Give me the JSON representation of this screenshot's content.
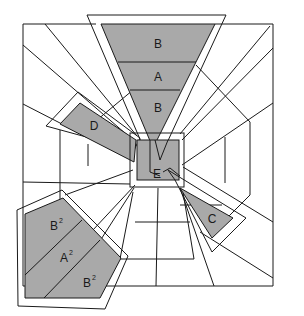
{
  "diagram": {
    "type": "perspective-tunnel-drawing",
    "colors": {
      "shade": "#a9a9a9",
      "line": "#1a1a1a",
      "background": "#ffffff"
    },
    "labels": {
      "top_b1": "B",
      "top_a": "A",
      "top_b2": "B",
      "d": "D",
      "e": "E",
      "c": "C",
      "ll_b1": "B",
      "ll_a": "A",
      "ll_b2": "B",
      "sup": "2"
    }
  }
}
